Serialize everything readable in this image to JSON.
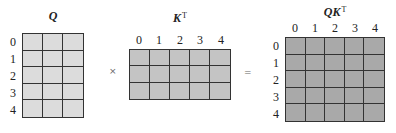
{
  "matrices": {
    "q": {
      "title": "Q",
      "rows": 5,
      "cols": 3,
      "row_labels": [
        "0",
        "1",
        "2",
        "3",
        "4"
      ],
      "col_labels": [],
      "fill_color": "#dcdcdc"
    },
    "kt": {
      "title": "K",
      "title_sup": "T",
      "rows": 3,
      "cols": 5,
      "row_labels": [],
      "col_labels": [
        "0",
        "1",
        "2",
        "3",
        "4"
      ],
      "fill_color": "#c4c4c4"
    },
    "qkt": {
      "title": "QK",
      "title_sup": "T",
      "rows": 5,
      "cols": 5,
      "row_labels": [
        "0",
        "1",
        "2",
        "3",
        "4"
      ],
      "col_labels": [
        "0",
        "1",
        "2",
        "3",
        "4"
      ],
      "fill_color": "#a9a9a9"
    }
  },
  "operators": {
    "multiply": "×",
    "equals": "="
  },
  "colors": {
    "grid_line": "#333333",
    "label_text": "#222222"
  }
}
